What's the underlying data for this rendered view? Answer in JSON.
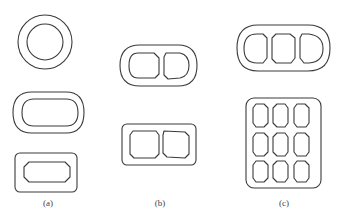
{
  "figure": {
    "type": "cross-section diagram",
    "line_color": "#3a3a3a",
    "background": "#ffffff",
    "panels": [
      {
        "id": "a",
        "label": "(a)",
        "shapes": [
          {
            "name": "circular-ring",
            "outer": "circle",
            "inner": "circle",
            "cells": 1
          },
          {
            "name": "stadium-ring",
            "outer": "stadium",
            "inner": "stadium",
            "cells": 1
          },
          {
            "name": "rounded-rect-ring",
            "outer": "rounded-rectangle",
            "inner": "octagon",
            "cells": 1
          }
        ]
      },
      {
        "id": "b",
        "label": "(b)",
        "shapes": [
          {
            "name": "stadium-two-cell",
            "outer": "stadium",
            "inner": "rounded-octagon",
            "cells": 2
          },
          {
            "name": "rounded-rect-two-cell",
            "outer": "rounded-rectangle",
            "inner": "octagon",
            "cells": 2
          }
        ]
      },
      {
        "id": "c",
        "label": "(c)",
        "shapes": [
          {
            "name": "stadium-three-cell",
            "outer": "stadium",
            "inner": "rounded-octagon",
            "cells": 3
          },
          {
            "name": "rounded-rect-nine-cell",
            "outer": "rounded-rectangle",
            "inner": "rounded-octagon",
            "cells": 9,
            "grid": [
              3,
              3
            ]
          }
        ]
      }
    ]
  }
}
